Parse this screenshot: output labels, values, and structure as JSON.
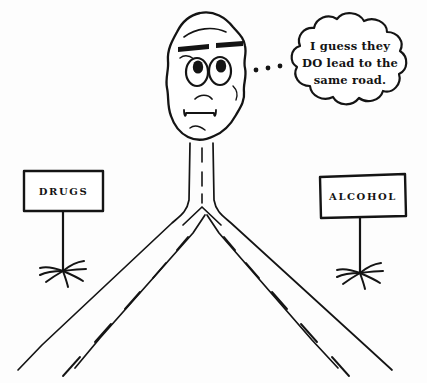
{
  "image": {
    "title": "Same Road Cartoon",
    "description": "Hand-drawn cartoon of a face atop a road that forks into two branches labeled DRUGS and ALCOHOL",
    "background_color": "#fdfdfd",
    "ink_color": "#141414"
  },
  "thought_bubble": {
    "name": "thought-bubble",
    "lines": [
      "I guess they",
      "DO lead to the",
      "same road."
    ],
    "full_text": "I guess they DO lead to the same road.",
    "trail_dot_count": 3
  },
  "signs": [
    {
      "id": "drugs",
      "label": "DRUGS",
      "side": "left"
    },
    {
      "id": "alcohol",
      "label": "ALCOHOL",
      "side": "right"
    }
  ],
  "character": {
    "name": "blob-face",
    "eye_count": 2,
    "expression": "worried"
  },
  "roads": [
    {
      "id": "left-road",
      "label_ref": "DRUGS"
    },
    {
      "id": "right-road",
      "label_ref": "ALCOHOL"
    }
  ]
}
